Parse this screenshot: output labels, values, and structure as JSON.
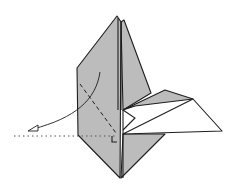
{
  "diagram": {
    "paper_color": "#bcbcbc",
    "line_color": "#1e1e1e",
    "background": "#ffffff",
    "annotations": [
      {
        "type": "valley-fold-line",
        "description": "dashed diagonal fold line across left panel"
      },
      {
        "type": "fold-arrow",
        "description": "curved arrow showing left flap folding down and left"
      },
      {
        "type": "reference-line",
        "description": "dotted horizontal guide line"
      },
      {
        "type": "right-angle-mark",
        "description": "small square marking right angle at fold base"
      }
    ]
  }
}
